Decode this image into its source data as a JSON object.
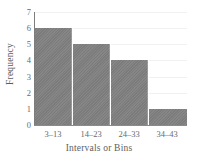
{
  "chart_data": {
    "type": "bar",
    "title": "",
    "subtitle": "",
    "categories": [
      "3–13",
      "14–23",
      "24–33",
      "34–43"
    ],
    "values": [
      6,
      5,
      4,
      1
    ],
    "xlabel": "Intervals or Bins",
    "ylabel": "Frequency",
    "ylim": [
      0,
      7
    ],
    "yticks": [
      0,
      1,
      2,
      3,
      4,
      5,
      6,
      7
    ],
    "ytick_labels": [
      "0",
      "1",
      "2",
      "3",
      "4",
      "5",
      "6",
      "7"
    ],
    "grid": true,
    "legend": false,
    "bar_color": "#808080",
    "bar_separator_color": "#ffffff",
    "axis_color": "#7d7d7d",
    "grid_color": "#f1f1f1",
    "text_color": "#5e5e5e",
    "background_color": "#ffffff"
  }
}
